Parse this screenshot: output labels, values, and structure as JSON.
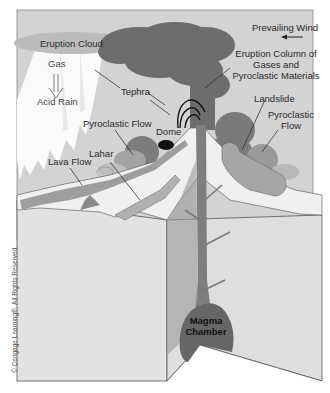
{
  "diagram": {
    "title": "",
    "labels": {
      "eruption_cloud": "Eruption Cloud",
      "gas": "Gas",
      "acid_rain": "Acid Rain",
      "tephra": "Tephra",
      "prevailing_wind": "Prevailing Wind",
      "eruption_column_line1": "Eruption Column of",
      "eruption_column_line2": "Gases and",
      "eruption_column_line3": "Pyroclastic Materials",
      "landslide": "Landslide",
      "pyroclastic_flow_right_line1": "Pyroclastic",
      "pyroclastic_flow_right_line2": "Flow",
      "pyroclastic_flow_left": "Pyroclastic Flow",
      "dome": "Dome",
      "lahar": "Lahar",
      "lava_flow": "Lava Flow",
      "magma_chamber_line1": "Magma",
      "magma_chamber_line2": "Chamber"
    },
    "copyright": "© Cengage Learning®. All Rights Reserved.",
    "colors": {
      "sky": "#d4d4d4",
      "cloud_dark": "#6e6e6e",
      "cloud_light": "#bdbdbd",
      "ground_face": "#e4e4e4",
      "slope": "#efefef",
      "magma": "#6a6a6a",
      "conduit": "#808080",
      "outline": "#555555",
      "rain_white": "#fbfbfb"
    }
  }
}
